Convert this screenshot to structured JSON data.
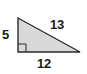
{
  "figure": {
    "background_color": "#ffffff",
    "shape": {
      "name": "right-triangle",
      "fill_color": "#d9d9d9",
      "stroke_color": "#2b2b2b",
      "vertices": [
        {
          "name": "top-left-apex",
          "x": 18,
          "y": 18
        },
        {
          "name": "bottom-right",
          "x": 80,
          "y": 52
        },
        {
          "name": "bottom-left-right-angle",
          "x": 18,
          "y": 52
        }
      ],
      "right_angle_marker": {
        "name": "right-angle-square",
        "x": 18,
        "y": 44,
        "size": 8,
        "stroke_color": "#2b2b2b"
      }
    },
    "labels": {
      "leg_vertical": "5",
      "hypotenuse": "13",
      "leg_horizontal": "12"
    }
  },
  "chart_data": {
    "type": "diagram",
    "sides": [
      {
        "name": "vertical leg",
        "label": "5",
        "value": 5
      },
      {
        "name": "horizontal leg",
        "label": "12",
        "value": 12
      },
      {
        "name": "hypotenuse",
        "label": "13",
        "value": 13
      }
    ]
  }
}
